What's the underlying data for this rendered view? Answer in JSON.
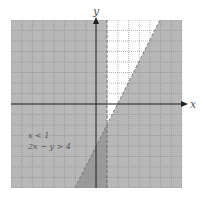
{
  "chart_data": {
    "type": "inequality-graph",
    "title": "",
    "xlabel": "x",
    "ylabel": "y",
    "xlim": [
      -8,
      8
    ],
    "ylim": [
      -8,
      8
    ],
    "grid": true,
    "inequalities": [
      "x < 1",
      "2x − y > 4"
    ],
    "boundaries": [
      {
        "equation": "x = 1",
        "style": "dashed"
      },
      {
        "equation": "2x − y = 4",
        "style": "dashed"
      }
    ],
    "shading_color": "#b8b8b8",
    "unshaded_region": "x > 1 and 2x − y < 4"
  },
  "labels": {
    "x_axis": "x",
    "y_axis": "y",
    "ineq1": "x < 1",
    "ineq2": "2x − y > 4"
  }
}
